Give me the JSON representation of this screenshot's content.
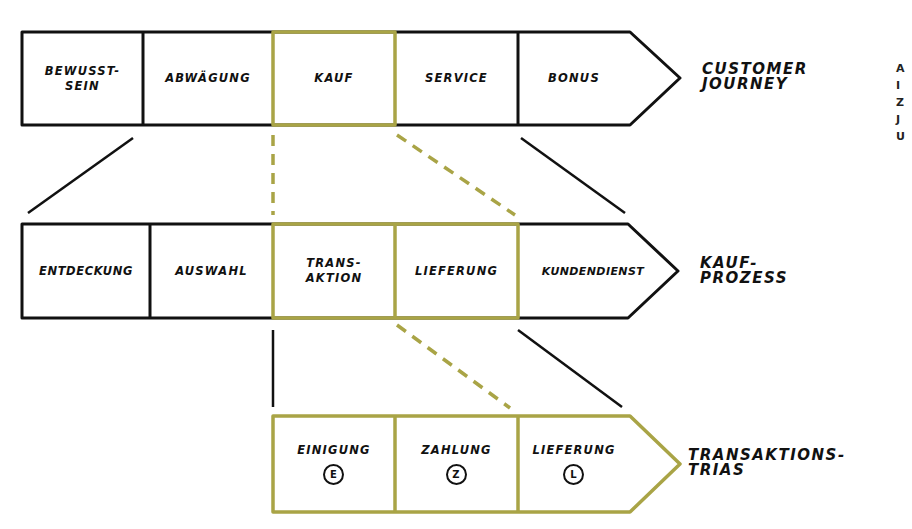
{
  "colors": {
    "ink": "#111111",
    "highlight": "#a9a446",
    "background": "#ffffff"
  },
  "customer_journey": {
    "label": "CUSTOMER\nJOURNEY",
    "stages": [
      "BEWUSST-\nSEIN",
      "ABWÄGUNG",
      "KAUF",
      "SERVICE",
      "BONUS"
    ],
    "highlighted_stage": "KAUF"
  },
  "kaufprozess": {
    "label": "KAUF-\nPROZESS",
    "stages": [
      "ENTDECKUNG",
      "AUSWAHL",
      "TRANS-\nAKTION",
      "LIEFERUNG",
      "KUNDENDIENST"
    ],
    "highlighted_stages": [
      "TRANS-\nAKTION",
      "LIEFERUNG"
    ]
  },
  "transaktionstrias": {
    "label": "TRANSAKTIONS-\nTRIAS",
    "stages": [
      {
        "name": "EINIGUNG",
        "symbol": "E"
      },
      {
        "name": "ZAHLUNG",
        "symbol": "Z"
      },
      {
        "name": "LIEFERUNG",
        "symbol": "L"
      }
    ]
  },
  "cropped_edge_text": "A\nI\nZ\nJ\nU"
}
